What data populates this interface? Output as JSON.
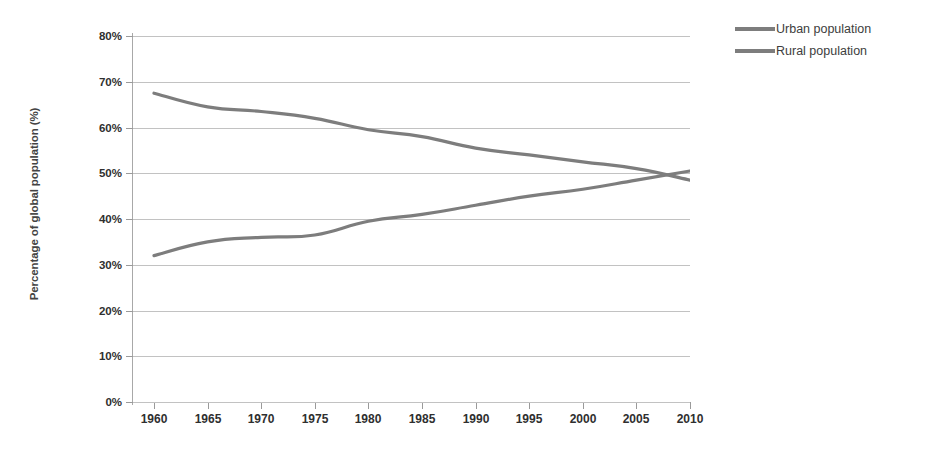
{
  "chart_data": {
    "type": "line",
    "title": "",
    "xlabel": "",
    "ylabel": "Percentage of global population (%)",
    "x": [
      1960,
      1965,
      1970,
      1975,
      1980,
      1985,
      1990,
      1995,
      2000,
      2005,
      2010
    ],
    "xlim": [
      1959,
      1971
    ],
    "ylim": [
      0,
      80
    ],
    "grid": true,
    "legend_position": "top-right",
    "y_tick_labels": [
      "0%",
      "10%",
      "20%",
      "30%",
      "40%",
      "50%",
      "60%",
      "70%",
      "80%"
    ],
    "y_tick_values": [
      0,
      10,
      20,
      30,
      40,
      50,
      60,
      70,
      80
    ],
    "x_tick_labels": [
      "1960",
      "1965",
      "1970",
      "1975",
      "1980",
      "1985",
      "1990",
      "1995",
      "2000",
      "2005",
      "2010"
    ],
    "series": [
      {
        "name": "Urban population",
        "color": "#7d7d7d",
        "values": [
          32.0,
          35.0,
          36.0,
          36.5,
          39.5,
          41.0,
          43.0,
          45.0,
          46.5,
          48.5,
          50.5
        ]
      },
      {
        "name": "Rural population",
        "color": "#7d7d7d",
        "values": [
          67.5,
          64.5,
          63.5,
          62.0,
          59.5,
          58.0,
          55.5,
          54.0,
          52.5,
          51.0,
          48.5
        ]
      }
    ]
  },
  "legend": {
    "entries": [
      {
        "label": "Urban population",
        "color": "#7d7d7d"
      },
      {
        "label": "Rural population",
        "color": "#7d7d7d"
      }
    ]
  },
  "axes": {
    "y_title": "Percentage of global population (%)"
  }
}
